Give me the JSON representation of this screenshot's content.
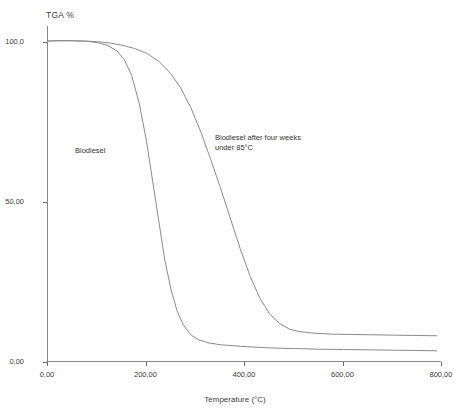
{
  "chart_data": {
    "type": "line",
    "title": "",
    "xlabel": "Temperature (°C)",
    "ylabel": "TGA %",
    "xlim": [
      0,
      800
    ],
    "ylim": [
      0,
      105
    ],
    "grid": false,
    "legend_position": "inline-annotations",
    "x_ticks": [
      "0,00",
      "200,00",
      "400,00",
      "600,00",
      "800,00"
    ],
    "x_tick_values": [
      0,
      200,
      400,
      600,
      800
    ],
    "y_ticks": [
      "100,0",
      "50,00",
      "0,00"
    ],
    "y_tick_values": [
      100,
      50,
      0
    ],
    "series": [
      {
        "name": "Biodiesel",
        "label": "Biodiesel",
        "color": "#8a8a8a",
        "x": [
          0,
          20,
          50,
          80,
          100,
          120,
          140,
          155,
          170,
          185,
          200,
          212,
          225,
          237,
          250,
          262,
          275,
          290,
          305,
          325,
          350,
          400,
          450,
          500,
          550,
          600,
          650,
          700,
          750,
          790
        ],
        "y": [
          100.3,
          100.4,
          100.4,
          100.2,
          99.8,
          99.0,
          97.2,
          94.5,
          89.5,
          81.0,
          69.0,
          57.0,
          44.0,
          32.0,
          22.5,
          16.0,
          11.5,
          8.5,
          7.0,
          6.0,
          5.4,
          4.8,
          4.4,
          4.2,
          4.0,
          3.9,
          3.8,
          3.7,
          3.6,
          3.5
        ]
      },
      {
        "name": "Biodiesel after four weeks under 85°C",
        "label": "Biodiesel after four weeks\nunder 85°C",
        "color": "#8a8a8a",
        "x": [
          0,
          25,
          50,
          75,
          100,
          125,
          150,
          175,
          200,
          225,
          250,
          270,
          290,
          310,
          330,
          350,
          370,
          390,
          410,
          430,
          450,
          470,
          490,
          510,
          540,
          580,
          620,
          660,
          700,
          740,
          790
        ],
        "y": [
          100.3,
          100.4,
          100.4,
          100.3,
          100.1,
          99.7,
          99.0,
          98.0,
          96.5,
          94.0,
          90.0,
          85.5,
          79.5,
          72.0,
          63.5,
          54.5,
          45.0,
          35.5,
          27.0,
          20.0,
          15.0,
          12.0,
          10.3,
          9.5,
          9.0,
          8.7,
          8.6,
          8.5,
          8.4,
          8.3,
          8.2
        ]
      }
    ]
  }
}
